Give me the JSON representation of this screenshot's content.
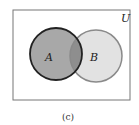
{
  "diagram": {
    "type": "venn",
    "universe_label": "U",
    "sets": [
      {
        "label": "A",
        "fill": "#a8a8a8",
        "stroke": "#222222"
      },
      {
        "label": "B",
        "fill": "#e2e2e2",
        "stroke": "#8a8a8a"
      }
    ],
    "intersection_fill": "#8e8e8e",
    "caption": "(c)"
  }
}
